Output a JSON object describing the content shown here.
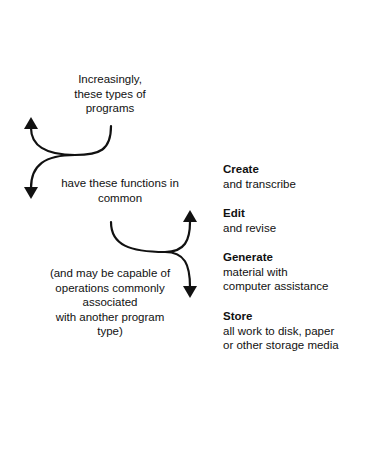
{
  "diagram": {
    "intro_lines": [
      "Increasingly,",
      "these types of",
      "programs"
    ],
    "middle_lines": [
      "have these functions in",
      "common"
    ],
    "note_lines": [
      "(and may be capable of",
      "operations commonly",
      "associated",
      "with another program",
      "type)"
    ],
    "functions": [
      {
        "title": "Create",
        "desc": [
          "and transcribe"
        ]
      },
      {
        "title": "Edit",
        "desc": [
          "and revise"
        ]
      },
      {
        "title": "Generate",
        "desc": [
          "material with",
          "computer assistance"
        ]
      },
      {
        "title": "Store",
        "desc": [
          "all work to disk, paper",
          "or other storage media"
        ]
      }
    ],
    "colors": {
      "ink": "#111111",
      "background": "#ffffff"
    }
  }
}
